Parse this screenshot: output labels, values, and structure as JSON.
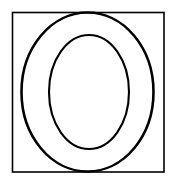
{
  "figure": {
    "canvas": {
      "width": 176,
      "height": 185,
      "background_color": "#ffffff"
    },
    "shapes": [
      {
        "id": "bounding-square",
        "type": "rect",
        "label": "Square border",
        "x": 12.5,
        "y": 12.5,
        "width": 151.5,
        "height": 159.5,
        "stroke_color": "#1a1a1a",
        "stroke_width": 1.6,
        "fill": "none"
      },
      {
        "id": "outer-ellipse",
        "type": "ellipse",
        "label": "Outer ellipse",
        "cx": 87.5,
        "cy": 92.0,
        "rx": 66.0,
        "ry": 79.5,
        "stroke_color": "#111111",
        "stroke_width": 2.6,
        "fill": "none"
      },
      {
        "id": "inner-ellipse",
        "type": "ellipse",
        "label": "Inner ellipse",
        "cx": 89.0,
        "cy": 92.0,
        "rx": 40.0,
        "ry": 57.0,
        "stroke_color": "#111111",
        "stroke_width": 2.1,
        "fill": "none"
      }
    ],
    "colors": {
      "stroke": "#111111",
      "square_stroke": "#1a1a1a",
      "background": "#ffffff"
    }
  }
}
